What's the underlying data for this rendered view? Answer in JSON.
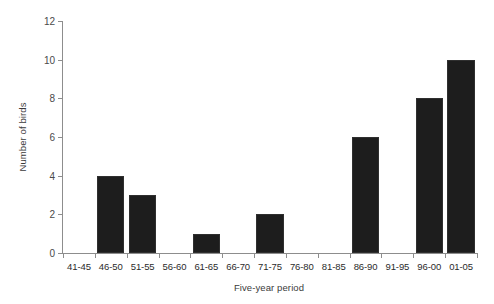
{
  "chart_data": {
    "type": "bar",
    "title": "",
    "subtitle": "",
    "xlabel": "Five-year period",
    "ylabel": "Number of birds",
    "categories": [
      "41-45",
      "46-50",
      "51-55",
      "56-60",
      "61-65",
      "66-70",
      "71-75",
      "76-80",
      "81-85",
      "86-90",
      "91-95",
      "96-00",
      "01-05"
    ],
    "values": [
      0,
      4,
      3,
      0,
      1,
      0,
      2,
      0,
      0,
      6,
      0,
      8,
      10
    ],
    "ylim": [
      0,
      12
    ],
    "yticks": [
      0,
      2,
      4,
      6,
      8,
      10,
      12
    ],
    "ytick_labels": [
      "0",
      "2",
      "4",
      "6",
      "8",
      "10",
      "12"
    ],
    "grid": false,
    "legend": null,
    "legend_position": "none",
    "bar_color": "#1d1d1d",
    "axis_color": "#8d8d8d",
    "annotations": []
  }
}
